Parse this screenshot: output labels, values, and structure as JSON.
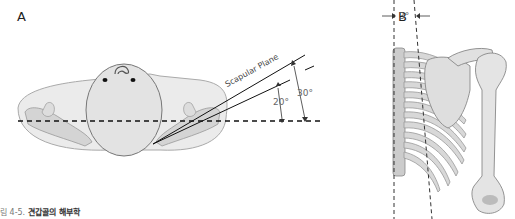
{
  "panels": {
    "a": {
      "label": "A",
      "plane_label": "Scapular Plane",
      "angle_small": "20°",
      "angle_large": "30°"
    },
    "b": {
      "label": "B",
      "angle": "3°"
    }
  },
  "caption": {
    "prefix": "림 4-5.",
    "title": "견갑골의 해부학"
  }
}
